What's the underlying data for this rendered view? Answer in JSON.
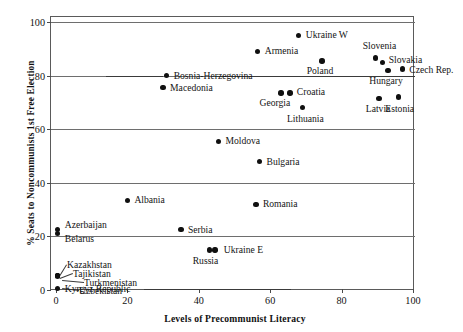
{
  "chart_data": {
    "type": "scatter",
    "title": "",
    "xlabel": "Levels of Precommunist Literacy",
    "ylabel": "% Seats to Noncommunists 1st Free Election",
    "xlim": [
      0,
      103
    ],
    "ylim": [
      0,
      103
    ],
    "xticks": [
      0,
      20,
      40,
      60,
      80,
      100
    ],
    "yticks": [
      0,
      20,
      40,
      60,
      80,
      100
    ],
    "grid": "horizontal",
    "legend": "none",
    "points": [
      {
        "label": "Ukraine W",
        "x": 68.0,
        "y": 95.0,
        "label_pos": "right"
      },
      {
        "label": "Armenia",
        "x": 56.5,
        "y": 89.0,
        "label_pos": "right"
      },
      {
        "label": "Slovenia",
        "x": 89.5,
        "y": 86.5,
        "label_pos": "above"
      },
      {
        "label": "Slovakia",
        "x": 91.5,
        "y": 85.0,
        "label_pos": "right"
      },
      {
        "label": "Poland",
        "x": 74.5,
        "y": 85.5,
        "label_pos": "below-right"
      },
      {
        "label": "Czech Rep.",
        "x": 97.0,
        "y": 82.5,
        "label_pos": "right"
      },
      {
        "label": "Hungary",
        "x": 93.0,
        "y": 82.0,
        "label_pos": "below"
      },
      {
        "label": "Bosnia-Herzegovina",
        "x": 31.0,
        "y": 80.0,
        "label_pos": "right"
      },
      {
        "label": "Macedonia",
        "x": 30.0,
        "y": 75.5,
        "label_pos": "right"
      },
      {
        "label": "Croatia",
        "x": 65.5,
        "y": 73.5,
        "label_pos": "right"
      },
      {
        "label": "Georgia",
        "x": 63.0,
        "y": 73.5,
        "label_pos": "below"
      },
      {
        "label": "Latvia",
        "x": 90.5,
        "y": 71.5,
        "label_pos": "below"
      },
      {
        "label": "Estonia",
        "x": 96.0,
        "y": 72.0,
        "label_pos": "below"
      },
      {
        "label": "Lithuania",
        "x": 69.0,
        "y": 68.0,
        "label_pos": "below-right"
      },
      {
        "label": "Moldova",
        "x": 45.5,
        "y": 55.5,
        "label_pos": "right"
      },
      {
        "label": "Bulgaria",
        "x": 57.0,
        "y": 48.0,
        "label_pos": "right"
      },
      {
        "label": "Romania",
        "x": 56.0,
        "y": 32.0,
        "label_pos": "right"
      },
      {
        "label": "Albania",
        "x": 20.0,
        "y": 33.5,
        "label_pos": "right"
      },
      {
        "label": "Serbia",
        "x": 35.0,
        "y": 22.5,
        "label_pos": "right"
      },
      {
        "label": "Azerbaijan",
        "x": 0.5,
        "y": 22.5,
        "label_pos": "right"
      },
      {
        "label": "Belarus",
        "x": 0.5,
        "y": 21.0,
        "label_pos": "right"
      },
      {
        "label": "Ukraine E",
        "x": 44.5,
        "y": 15.0,
        "label_pos": "right"
      },
      {
        "label": "Russia",
        "x": 43.0,
        "y": 15.0,
        "label_pos": "below-left"
      },
      {
        "label": "Kazakhstan",
        "x": 0.5,
        "y": 5.5,
        "label_pos": "leader"
      },
      {
        "label": "Tajikistan",
        "x": 0.5,
        "y": 5.5,
        "label_pos": "leader"
      },
      {
        "label": "Turkmenistan",
        "x": 0.5,
        "y": 5.5,
        "label_pos": "leader"
      },
      {
        "label": "Uzbekistan",
        "x": 0.5,
        "y": 5.0,
        "label_pos": "leader"
      },
      {
        "label": "Kyrgyz Republic",
        "x": 0.5,
        "y": 0.5,
        "label_pos": "right"
      }
    ]
  },
  "axes": {
    "y_title": "% Seats to Noncommunists 1st Free Election",
    "x_title": "Levels of Precommunist Literacy",
    "y_tick_labels": [
      "0",
      "20",
      "40",
      "60",
      "80",
      "100"
    ],
    "x_tick_labels": [
      "0",
      "20",
      "40",
      "60",
      "80",
      "100"
    ]
  },
  "labels": {
    "ukraine_w": "Ukraine W",
    "armenia": "Armenia",
    "slovenia": "Slovenia",
    "slovakia": "Slovakia",
    "poland": "Poland",
    "czech_rep": "Czech Rep.",
    "hungary": "Hungary",
    "bosnia": "Bosnia-Herzegovina",
    "macedonia": "Macedonia",
    "croatia": "Croatia",
    "georgia": "Georgia",
    "latvia": "Latvia",
    "estonia": "Estonia",
    "lithuania": "Lithuania",
    "moldova": "Moldova",
    "bulgaria": "Bulgaria",
    "romania": "Romania",
    "albania": "Albania",
    "serbia": "Serbia",
    "azerbaijan": "Azerbaijan",
    "belarus": "Belarus",
    "ukraine_e": "Ukraine E",
    "russia": "Russia",
    "kazakhstan": "Kazakhstan",
    "tajikistan": "Tajikistan",
    "turkmenistan": "Turkmenistan",
    "uzbekistan": "Uzbekistan",
    "kyrgyz": "Kyrgyz Republic"
  },
  "colors": {
    "dot": "#101010",
    "frame": "#5a5a5a",
    "grid": "#6e6e6e",
    "text": "#141414",
    "background": "#ffffff"
  }
}
